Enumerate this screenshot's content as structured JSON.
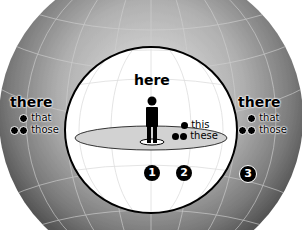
{
  "diagram": {
    "type": "concentric-spheres",
    "colors": {
      "outer_sphere_light": "#d8d8d8",
      "outer_sphere_dark": "#5a5a5a",
      "inner_sphere": "#ffffff",
      "disc": "#d2d2d2",
      "grid": "#e4e4e4",
      "ink": "#000000"
    },
    "inner": {
      "title": "here",
      "proximal_near": {
        "dots": 1,
        "label": "this"
      },
      "proximal_plural": {
        "dots": 2,
        "label": "these"
      },
      "markers": [
        "1",
        "2"
      ]
    },
    "left_outer": {
      "title": "there",
      "singular": {
        "dots": 1,
        "label": "that"
      },
      "plural": {
        "dots": 2,
        "label": "those"
      }
    },
    "right_outer": {
      "title": "there",
      "singular": {
        "dots": 1,
        "label": "that"
      },
      "plural": {
        "dots": 2,
        "label": "those"
      },
      "marker": "3"
    }
  }
}
